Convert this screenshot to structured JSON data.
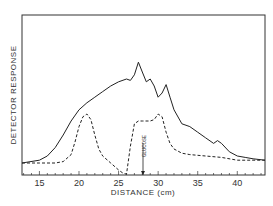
{
  "chart_data": {
    "type": "line",
    "title": "",
    "xlabel": "DISTANCE (cm)",
    "ylabel": "DETECTOR RESPONSE",
    "xlim": [
      12.8,
      43.5
    ],
    "xticks": [
      15,
      20,
      25,
      30,
      35,
      40
    ],
    "grid": false,
    "annotations": [
      {
        "text": "GLUCOSE",
        "x": 28.2,
        "style": "vertical arrow pointing to x-axis"
      }
    ],
    "series": [
      {
        "name": "solid",
        "style": "solid",
        "x": [
          12.8,
          15,
          16,
          17,
          18,
          19,
          20,
          21,
          22,
          23,
          24,
          25,
          26,
          26.5,
          27,
          27.5,
          28,
          28.5,
          29,
          29.5,
          30,
          30.5,
          31,
          31.5,
          32,
          33,
          34,
          35,
          36,
          37,
          37.5,
          38,
          39,
          40,
          41,
          42,
          43.5
        ],
        "y": [
          0,
          0.02,
          0.05,
          0.11,
          0.2,
          0.3,
          0.38,
          0.43,
          0.47,
          0.51,
          0.55,
          0.58,
          0.6,
          0.59,
          0.63,
          0.72,
          0.65,
          0.58,
          0.6,
          0.55,
          0.47,
          0.5,
          0.56,
          0.47,
          0.38,
          0.28,
          0.26,
          0.22,
          0.18,
          0.14,
          0.16,
          0.14,
          0.08,
          0.05,
          0.04,
          0.03,
          0.02
        ]
      },
      {
        "name": "dashed",
        "style": "dashed",
        "x": [
          12.8,
          15,
          17,
          18,
          19,
          19.5,
          20,
          20.5,
          21,
          21.5,
          22,
          22.5,
          23,
          24,
          25,
          25.5,
          26,
          26.5,
          27,
          27.5,
          28,
          29,
          29.5,
          30,
          30.5,
          31,
          31.5,
          32,
          33,
          34,
          36,
          38,
          40,
          42,
          43.5
        ],
        "y": [
          0,
          0,
          0,
          0.01,
          0.06,
          0.15,
          0.26,
          0.33,
          0.35,
          0.31,
          0.2,
          0.1,
          0.05,
          0.0,
          -0.05,
          -0.07,
          -0.08,
          0.12,
          0.28,
          0.3,
          0.3,
          0.3,
          0.31,
          0.35,
          0.33,
          0.22,
          0.14,
          0.1,
          0.07,
          0.06,
          0.05,
          0.04,
          0.02,
          0.02,
          0.02
        ]
      }
    ]
  },
  "axes": {
    "xlabel": "DISTANCE (cm)",
    "ylabel": "DETECTOR RESPONSE",
    "ticks": [
      "15",
      "20",
      "25",
      "30",
      "35",
      "40"
    ]
  },
  "annotation": {
    "label": "GLUCOSE"
  }
}
